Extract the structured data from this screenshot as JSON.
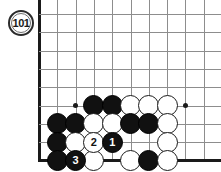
{
  "figure": {
    "label": "101",
    "type": "go-board-diagram"
  },
  "board": {
    "edges": {
      "left": true,
      "bottom": true,
      "top": false,
      "right": false
    },
    "grid": {
      "origin_x": 39,
      "origin_y": 14,
      "spacing": 18.3,
      "cols": 11,
      "rows": 9,
      "line_color": "#8d8d8d",
      "edge_color": "#1a1a1a"
    },
    "star_points": [
      {
        "col": 2,
        "row": 5
      },
      {
        "col": 8,
        "row": 5
      }
    ],
    "stones": [
      {
        "col": 3,
        "row": 5,
        "color": "black",
        "label": ""
      },
      {
        "col": 4,
        "row": 5,
        "color": "black",
        "label": ""
      },
      {
        "col": 5,
        "row": 5,
        "color": "white",
        "label": ""
      },
      {
        "col": 6,
        "row": 5,
        "color": "white",
        "label": ""
      },
      {
        "col": 7,
        "row": 5,
        "color": "white",
        "label": ""
      },
      {
        "col": 1,
        "row": 6,
        "color": "black",
        "label": ""
      },
      {
        "col": 2,
        "row": 6,
        "color": "black",
        "label": ""
      },
      {
        "col": 3,
        "row": 6,
        "color": "white",
        "label": ""
      },
      {
        "col": 4,
        "row": 6,
        "color": "white",
        "label": ""
      },
      {
        "col": 5,
        "row": 6,
        "color": "black",
        "label": ""
      },
      {
        "col": 6,
        "row": 6,
        "color": "black",
        "label": ""
      },
      {
        "col": 7,
        "row": 6,
        "color": "white",
        "label": ""
      },
      {
        "col": 1,
        "row": 7,
        "color": "black",
        "label": ""
      },
      {
        "col": 2,
        "row": 7,
        "color": "white",
        "label": ""
      },
      {
        "col": 3,
        "row": 7,
        "color": "white",
        "label": "2"
      },
      {
        "col": 4,
        "row": 7,
        "color": "black",
        "label": "1"
      },
      {
        "col": 7,
        "row": 7,
        "color": "white",
        "label": ""
      },
      {
        "col": 1,
        "row": 8,
        "color": "black",
        "label": ""
      },
      {
        "col": 2,
        "row": 8,
        "color": "black",
        "label": "3"
      },
      {
        "col": 3,
        "row": 8,
        "color": "white",
        "label": ""
      },
      {
        "col": 5,
        "row": 8,
        "color": "white",
        "label": ""
      },
      {
        "col": 6,
        "row": 8,
        "color": "black",
        "label": ""
      },
      {
        "col": 7,
        "row": 8,
        "color": "white",
        "label": ""
      }
    ]
  },
  "colors": {
    "black_stone": "#111111",
    "white_stone": "#ffffff",
    "stone_outline": "#1a1a1a",
    "grid_line": "#8d8d8d",
    "board_edge": "#1a1a1a",
    "background": "#ffffff"
  }
}
